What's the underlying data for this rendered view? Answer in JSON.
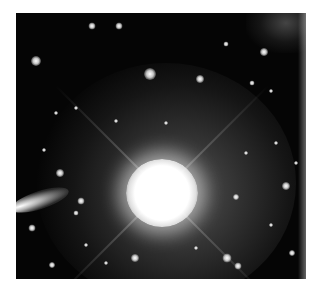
{
  "figure": {
    "colors": {
      "background": "#050505",
      "star": "#ffffff",
      "halo": "#8c8c8c"
    },
    "bright_star": {
      "x": 146,
      "y": 180,
      "radius": 34
    },
    "stars": [
      {
        "x": 20,
        "y": 48,
        "size": 10
      },
      {
        "x": 76,
        "y": 13,
        "size": 7
      },
      {
        "x": 103,
        "y": 13,
        "size": 7
      },
      {
        "x": 134,
        "y": 61,
        "size": 12
      },
      {
        "x": 184,
        "y": 66,
        "size": 8
      },
      {
        "x": 248,
        "y": 39,
        "size": 8
      },
      {
        "x": 210,
        "y": 31,
        "size": 5
      },
      {
        "x": 44,
        "y": 160,
        "size": 8
      },
      {
        "x": 65,
        "y": 188,
        "size": 7
      },
      {
        "x": 60,
        "y": 200,
        "size": 5
      },
      {
        "x": 16,
        "y": 215,
        "size": 7
      },
      {
        "x": 36,
        "y": 252,
        "size": 6
      },
      {
        "x": 119,
        "y": 245,
        "size": 8
      },
      {
        "x": 211,
        "y": 245,
        "size": 9
      },
      {
        "x": 222,
        "y": 253,
        "size": 7
      },
      {
        "x": 270,
        "y": 173,
        "size": 8
      },
      {
        "x": 220,
        "y": 184,
        "size": 6
      },
      {
        "x": 276,
        "y": 240,
        "size": 6
      },
      {
        "x": 60,
        "y": 95,
        "size": 4
      },
      {
        "x": 40,
        "y": 100,
        "size": 4
      },
      {
        "x": 100,
        "y": 108,
        "size": 4
      },
      {
        "x": 236,
        "y": 70,
        "size": 5
      },
      {
        "x": 255,
        "y": 78,
        "size": 4
      },
      {
        "x": 28,
        "y": 137,
        "size": 4
      },
      {
        "x": 70,
        "y": 232,
        "size": 4
      },
      {
        "x": 260,
        "y": 130,
        "size": 4
      },
      {
        "x": 280,
        "y": 150,
        "size": 4
      },
      {
        "x": 150,
        "y": 110,
        "size": 4
      },
      {
        "x": 230,
        "y": 140,
        "size": 4
      },
      {
        "x": 255,
        "y": 212,
        "size": 4
      },
      {
        "x": 180,
        "y": 235,
        "size": 4
      },
      {
        "x": 90,
        "y": 250,
        "size": 4
      }
    ]
  }
}
